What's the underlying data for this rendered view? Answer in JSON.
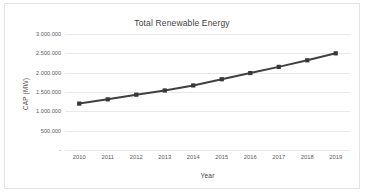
{
  "chart_data": {
    "type": "line",
    "title": "Total Renewable Energy",
    "xlabel": "Year",
    "ylabel": "CAP (MW)",
    "categories": [
      "2010",
      "2011",
      "2012",
      "2013",
      "2014",
      "2015",
      "2016",
      "2017",
      "2018",
      "2019"
    ],
    "x": [
      2010,
      2011,
      2012,
      2013,
      2014,
      2015,
      2016,
      2017,
      2018,
      2019
    ],
    "values": [
      1200000,
      1310000,
      1430000,
      1540000,
      1670000,
      1830000,
      1990000,
      2150000,
      2320000,
      2500000
    ],
    "series": [
      {
        "name": "Total Renewable Energy",
        "values": [
          1200000,
          1310000,
          1430000,
          1540000,
          1670000,
          1830000,
          1990000,
          2150000,
          2320000,
          2500000
        ]
      }
    ],
    "ylim": [
      0,
      3000000
    ],
    "ytick_values": [
      0,
      500000,
      1000000,
      1500000,
      2000000,
      2500000,
      3000000
    ],
    "ytick_labels": [
      "-",
      "500.000",
      "1.000.000",
      "1.500.000",
      "2.000.000",
      "2.500.000",
      "3.000.000"
    ],
    "grid": true,
    "grid_axis": "y",
    "legend": false,
    "legend_position": "none",
    "marker": "square",
    "line_color": "#404040",
    "marker_color": "#383838",
    "gridline_color": "#e8e8e8",
    "plot_background": "#ffffff",
    "border_color": "#e3e3e3",
    "annotations": []
  }
}
